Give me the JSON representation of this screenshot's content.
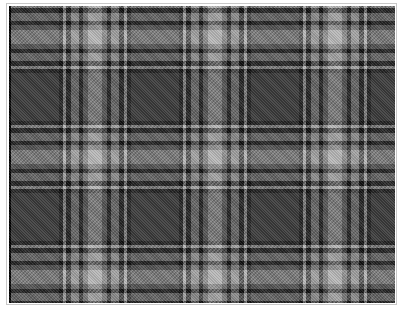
{
  "image": {
    "description": "Black, white and grey tartan plaid fabric swatch",
    "pattern": "tartan",
    "colors": {
      "background_grey": "#5a5a5a",
      "dark_block": "#3a3a3a",
      "black_stripe": "#111111",
      "mid_grey": "#8a8a8a",
      "light_grey": "#b4b4b4",
      "white_stripe": "#e6e6e6",
      "frame_border": "#c8c8c8"
    },
    "repeat_px": {
      "horizontal": 117,
      "vertical": 117
    }
  }
}
